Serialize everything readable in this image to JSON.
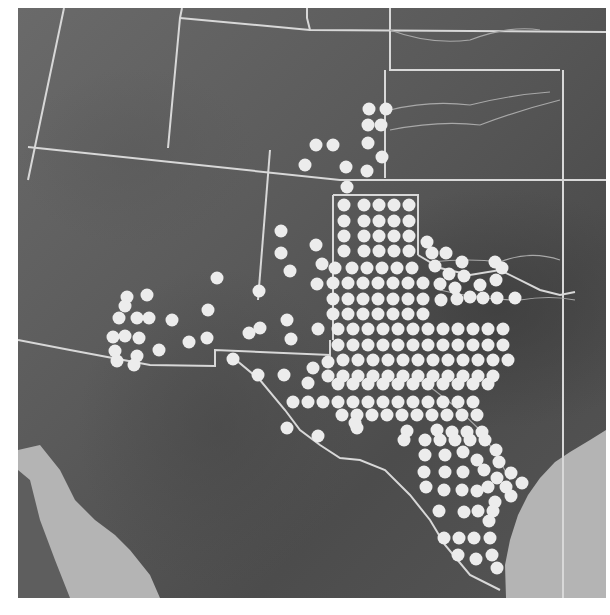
{
  "map": {
    "type": "shaded-relief",
    "region": "Southwestern United States and northern Mexico",
    "colors": {
      "land": "#5a5a5a",
      "water": "#b4b4b4",
      "borders": "#d8d8d8",
      "dots": "#ececec"
    },
    "dot_radius": 6.5,
    "dots": [
      [
        369,
        109
      ],
      [
        386,
        109
      ],
      [
        368,
        125
      ],
      [
        381,
        125
      ],
      [
        316,
        145
      ],
      [
        333,
        145
      ],
      [
        368,
        143
      ],
      [
        305,
        165
      ],
      [
        346,
        167
      ],
      [
        382,
        157
      ],
      [
        367,
        171
      ],
      [
        347,
        187
      ],
      [
        344,
        205
      ],
      [
        364,
        205
      ],
      [
        379,
        205
      ],
      [
        394,
        205
      ],
      [
        409,
        205
      ],
      [
        344,
        221
      ],
      [
        364,
        221
      ],
      [
        379,
        221
      ],
      [
        394,
        221
      ],
      [
        409,
        221
      ],
      [
        344,
        236
      ],
      [
        364,
        236
      ],
      [
        379,
        236
      ],
      [
        394,
        236
      ],
      [
        409,
        236
      ],
      [
        427,
        242
      ],
      [
        344,
        251
      ],
      [
        364,
        251
      ],
      [
        379,
        251
      ],
      [
        394,
        251
      ],
      [
        409,
        251
      ],
      [
        432,
        253
      ],
      [
        446,
        253
      ],
      [
        335,
        268
      ],
      [
        352,
        268
      ],
      [
        367,
        268
      ],
      [
        382,
        268
      ],
      [
        397,
        268
      ],
      [
        412,
        268
      ],
      [
        435,
        266
      ],
      [
        462,
        262
      ],
      [
        495,
        262
      ],
      [
        333,
        283
      ],
      [
        348,
        283
      ],
      [
        363,
        283
      ],
      [
        378,
        283
      ],
      [
        393,
        283
      ],
      [
        408,
        283
      ],
      [
        423,
        283
      ],
      [
        449,
        274
      ],
      [
        464,
        276
      ],
      [
        502,
        268
      ],
      [
        496,
        280
      ],
      [
        333,
        299
      ],
      [
        348,
        299
      ],
      [
        363,
        299
      ],
      [
        378,
        299
      ],
      [
        393,
        299
      ],
      [
        408,
        299
      ],
      [
        423,
        299
      ],
      [
        440,
        284
      ],
      [
        455,
        288
      ],
      [
        480,
        285
      ],
      [
        333,
        314
      ],
      [
        348,
        314
      ],
      [
        363,
        314
      ],
      [
        378,
        314
      ],
      [
        393,
        314
      ],
      [
        408,
        314
      ],
      [
        423,
        314
      ],
      [
        441,
        300
      ],
      [
        457,
        299
      ],
      [
        470,
        297
      ],
      [
        483,
        298
      ],
      [
        497,
        298
      ],
      [
        515,
        298
      ],
      [
        338,
        329
      ],
      [
        353,
        329
      ],
      [
        368,
        329
      ],
      [
        383,
        329
      ],
      [
        398,
        329
      ],
      [
        413,
        329
      ],
      [
        428,
        329
      ],
      [
        443,
        329
      ],
      [
        458,
        329
      ],
      [
        473,
        329
      ],
      [
        488,
        329
      ],
      [
        503,
        329
      ],
      [
        338,
        345
      ],
      [
        353,
        345
      ],
      [
        368,
        345
      ],
      [
        383,
        345
      ],
      [
        398,
        345
      ],
      [
        413,
        345
      ],
      [
        428,
        345
      ],
      [
        443,
        345
      ],
      [
        458,
        345
      ],
      [
        473,
        345
      ],
      [
        488,
        345
      ],
      [
        503,
        345
      ],
      [
        343,
        360
      ],
      [
        358,
        360
      ],
      [
        373,
        360
      ],
      [
        388,
        360
      ],
      [
        403,
        360
      ],
      [
        418,
        360
      ],
      [
        433,
        360
      ],
      [
        448,
        360
      ],
      [
        463,
        360
      ],
      [
        478,
        360
      ],
      [
        493,
        360
      ],
      [
        508,
        360
      ],
      [
        328,
        362
      ],
      [
        313,
        368
      ],
      [
        328,
        376
      ],
      [
        343,
        376
      ],
      [
        358,
        376
      ],
      [
        373,
        376
      ],
      [
        388,
        376
      ],
      [
        403,
        376
      ],
      [
        418,
        376
      ],
      [
        433,
        376
      ],
      [
        448,
        376
      ],
      [
        463,
        376
      ],
      [
        478,
        376
      ],
      [
        493,
        376
      ],
      [
        308,
        383
      ],
      [
        338,
        384
      ],
      [
        353,
        384
      ],
      [
        368,
        384
      ],
      [
        383,
        384
      ],
      [
        398,
        384
      ],
      [
        413,
        384
      ],
      [
        428,
        384
      ],
      [
        443,
        384
      ],
      [
        458,
        384
      ],
      [
        473,
        384
      ],
      [
        488,
        384
      ],
      [
        293,
        402
      ],
      [
        308,
        402
      ],
      [
        323,
        402
      ],
      [
        338,
        402
      ],
      [
        353,
        402
      ],
      [
        368,
        402
      ],
      [
        383,
        402
      ],
      [
        398,
        402
      ],
      [
        413,
        402
      ],
      [
        428,
        402
      ],
      [
        443,
        402
      ],
      [
        458,
        402
      ],
      [
        473,
        402
      ],
      [
        342,
        415
      ],
      [
        357,
        415
      ],
      [
        372,
        415
      ],
      [
        387,
        415
      ],
      [
        402,
        415
      ],
      [
        417,
        415
      ],
      [
        432,
        415
      ],
      [
        447,
        415
      ],
      [
        462,
        415
      ],
      [
        477,
        415
      ],
      [
        287,
        428
      ],
      [
        357,
        428
      ],
      [
        407,
        431
      ],
      [
        437,
        430
      ],
      [
        452,
        432
      ],
      [
        467,
        432
      ],
      [
        482,
        432
      ],
      [
        318,
        436
      ],
      [
        355,
        423
      ],
      [
        404,
        440
      ],
      [
        425,
        440
      ],
      [
        440,
        440
      ],
      [
        455,
        440
      ],
      [
        470,
        440
      ],
      [
        485,
        440
      ],
      [
        425,
        455
      ],
      [
        445,
        455
      ],
      [
        463,
        452
      ],
      [
        496,
        450
      ],
      [
        477,
        460
      ],
      [
        499,
        462
      ],
      [
        424,
        472
      ],
      [
        445,
        472
      ],
      [
        463,
        472
      ],
      [
        484,
        470
      ],
      [
        497,
        478
      ],
      [
        511,
        473
      ],
      [
        426,
        487
      ],
      [
        444,
        490
      ],
      [
        462,
        490
      ],
      [
        477,
        491
      ],
      [
        488,
        487
      ],
      [
        506,
        487
      ],
      [
        522,
        483
      ],
      [
        511,
        496
      ],
      [
        495,
        502
      ],
      [
        439,
        511
      ],
      [
        464,
        512
      ],
      [
        478,
        511
      ],
      [
        493,
        511
      ],
      [
        489,
        521
      ],
      [
        444,
        538
      ],
      [
        459,
        538
      ],
      [
        474,
        538
      ],
      [
        490,
        538
      ],
      [
        458,
        555
      ],
      [
        476,
        559
      ],
      [
        492,
        555
      ],
      [
        497,
        568
      ],
      [
        127,
        297
      ],
      [
        147,
        295
      ],
      [
        125,
        306
      ],
      [
        119,
        318
      ],
      [
        137,
        318
      ],
      [
        149,
        318
      ],
      [
        113,
        337
      ],
      [
        125,
        336
      ],
      [
        139,
        338
      ],
      [
        115,
        351
      ],
      [
        137,
        356
      ],
      [
        117,
        361
      ],
      [
        134,
        365
      ],
      [
        172,
        320
      ],
      [
        159,
        350
      ],
      [
        217,
        278
      ],
      [
        208,
        310
      ],
      [
        207,
        338
      ],
      [
        189,
        342
      ],
      [
        233,
        359
      ],
      [
        258,
        375
      ],
      [
        284,
        375
      ],
      [
        281,
        231
      ],
      [
        316,
        245
      ],
      [
        281,
        253
      ],
      [
        322,
        264
      ],
      [
        290,
        271
      ],
      [
        317,
        284
      ],
      [
        259,
        291
      ],
      [
        287,
        320
      ],
      [
        318,
        329
      ],
      [
        249,
        333
      ],
      [
        291,
        339
      ],
      [
        260,
        328
      ]
    ]
  }
}
